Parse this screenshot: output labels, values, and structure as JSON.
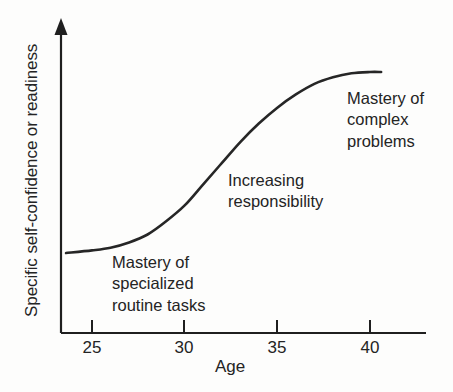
{
  "chart_data": {
    "type": "line",
    "title": "",
    "xlabel": "Age",
    "ylabel": "Specific self-confidence or readiness",
    "xlim": [
      23.5,
      42
    ],
    "ylim": [
      0,
      1
    ],
    "grid": false,
    "legend": null,
    "xticks": [
      25,
      30,
      35,
      40
    ],
    "xtick_labels": [
      "25",
      "30",
      "35",
      "40"
    ],
    "yticks": [],
    "ytick_labels": [],
    "series": [
      {
        "name": "Specific self-confidence or readiness",
        "color": "#262626",
        "x": [
          23.6,
          25,
          26,
          27,
          28,
          29,
          30,
          31,
          32,
          33,
          34,
          35,
          36,
          37,
          38,
          39,
          40,
          40.6
        ],
        "y": [
          0.29,
          0.3,
          0.31,
          0.33,
          0.36,
          0.41,
          0.47,
          0.55,
          0.63,
          0.71,
          0.78,
          0.84,
          0.89,
          0.93,
          0.955,
          0.97,
          0.975,
          0.975
        ]
      }
    ],
    "annotations": [
      {
        "name": "mastery-of-specialized-routine-tasks",
        "lines": [
          "Mastery of",
          "specialized",
          "routine tasks"
        ],
        "x": 25.4,
        "y": 0.22
      },
      {
        "name": "increasing-responsibility",
        "lines": [
          "Increasing",
          "responsibility"
        ],
        "x": 32.5,
        "y": 0.5
      },
      {
        "name": "mastery-of-complex-problems",
        "lines": [
          "Mastery of",
          "complex",
          "problems"
        ],
        "x": 38.9,
        "y": 0.88
      }
    ]
  },
  "axes": {
    "x_title": "Age",
    "y_title": "Specific self-confidence or readiness",
    "tick_25": "25",
    "tick_30": "30",
    "tick_35": "35",
    "tick_40": "40"
  },
  "annotations": {
    "low": {
      "line1": "Mastery of",
      "line2": "specialized",
      "line3": "routine tasks"
    },
    "mid": {
      "line1": "Increasing",
      "line2": "responsibility"
    },
    "high": {
      "line1": "Mastery of",
      "line2": "complex",
      "line3": "problems"
    }
  },
  "colors": {
    "curve": "#262626",
    "axis": "#1f1f1f",
    "text": "#242424",
    "background": "#fdfdfc"
  }
}
